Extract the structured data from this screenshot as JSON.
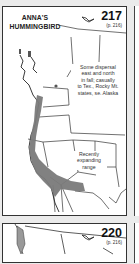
{
  "panels": [
    {
      "species": "ANNA'S HUMMINGBIRD",
      "title_line1": "ANNA'S",
      "title_line2": "HUMMINGBIRD",
      "map_number": "217",
      "page_ref": "(p. 216)",
      "notes": {
        "dispersal": [
          "Some dispersal",
          "east and north",
          "in fall; casually",
          "to Tex., Rocky Mt.",
          "states, se. Alaska"
        ],
        "expanding": [
          "Recently",
          "expanding",
          "range"
        ]
      },
      "range_color": "#7a7a7a",
      "icon": "bird-silhouette-icon"
    },
    {
      "map_number": "220",
      "page_ref": "(p. 216)",
      "icon": "bird-silhouette-icon"
    }
  ]
}
